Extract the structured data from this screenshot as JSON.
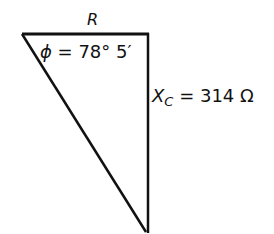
{
  "diagram": {
    "type": "impedance-triangle",
    "labels": {
      "resistance": "R",
      "phase_symbol": "ϕ",
      "phase_equals": " = 78° 5′",
      "reactance_symbol": "X",
      "reactance_subscript": "C",
      "reactance_value": " = 314 Ω"
    },
    "colors": {
      "stroke": "#111111",
      "background": "#ffffff"
    }
  }
}
